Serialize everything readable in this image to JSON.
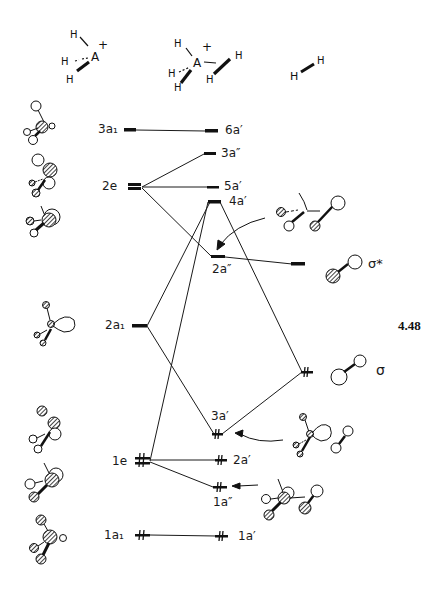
{
  "figure_number": "4.48",
  "headers": {
    "left_fragment": {
      "atoms": [
        "H",
        "H",
        "H",
        "A"
      ],
      "charge": "+"
    },
    "middle_molecule": {
      "atoms": [
        "H",
        "H",
        "H",
        "A",
        "H",
        "H"
      ],
      "charge": "+"
    },
    "right_fragment": {
      "atoms": [
        "H",
        "H"
      ]
    }
  },
  "left_levels": [
    {
      "id": "3a1",
      "label": "3a₁",
      "y": 130,
      "electrons": 0
    },
    {
      "id": "2e",
      "label": "2e",
      "y": 186,
      "electrons": 0,
      "degenerate": true
    },
    {
      "id": "2a1",
      "label": "2a₁",
      "y": 326,
      "electrons": 0
    },
    {
      "id": "1e",
      "label": "1e",
      "y": 461,
      "electrons": 4,
      "degenerate": true
    },
    {
      "id": "1a1",
      "label": "1a₁",
      "y": 535,
      "electrons": 2
    }
  ],
  "middle_levels": [
    {
      "id": "6a'",
      "label": "6a′",
      "y": 131,
      "electrons": 0
    },
    {
      "id": "3a''",
      "label": "3a″",
      "y": 154,
      "electrons": 0
    },
    {
      "id": "5a'",
      "label": "5a′",
      "y": 187,
      "electrons": 0
    },
    {
      "id": "4a'",
      "label": "4a′",
      "y": 202,
      "electrons": 0
    },
    {
      "id": "2a''",
      "label": "2a″",
      "y": 257,
      "electrons": 0
    },
    {
      "id": "3a'",
      "label": "3a′",
      "y": 434,
      "electrons": 2
    },
    {
      "id": "2a'",
      "label": "2a′",
      "y": 460,
      "electrons": 2
    },
    {
      "id": "1a''",
      "label": "1a″",
      "y": 487,
      "electrons": 2
    },
    {
      "id": "1a'",
      "label": "1a′",
      "y": 536,
      "electrons": 2
    }
  ],
  "right_levels": [
    {
      "id": "sigma_star",
      "label": "σ*",
      "y": 264,
      "electrons": 0
    },
    {
      "id": "sigma",
      "label": "σ",
      "y": 372,
      "electrons": 2
    }
  ],
  "correlation_lines": [
    [
      "3a1",
      "6a'"
    ],
    [
      "2e",
      "3a''"
    ],
    [
      "2e",
      "5a'"
    ],
    [
      "2e",
      "2a''"
    ],
    [
      "2a1",
      "4a'"
    ],
    [
      "2a1",
      "3a'"
    ],
    [
      "1e",
      "4a'"
    ],
    [
      "1e",
      "2a'"
    ],
    [
      "1e",
      "1a''"
    ],
    [
      "1a1",
      "1a'"
    ],
    [
      "sigma_star",
      "2a''"
    ],
    [
      "sigma",
      "4a'"
    ],
    [
      "sigma",
      "3a'"
    ]
  ],
  "arrows": [
    {
      "from": "orbital-sketch-2a''",
      "to": "2a''"
    },
    {
      "from": "orbital-sketch-3a'",
      "to": "3a'"
    },
    {
      "from": "orbital-sketch-1a''",
      "to": "1a''"
    }
  ],
  "colors": {
    "ink": "#1a1a1a",
    "background": "#ffffff"
  }
}
